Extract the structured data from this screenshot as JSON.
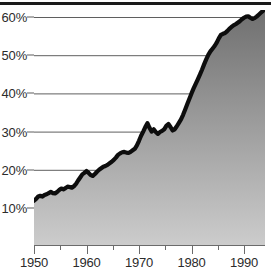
{
  "chart_data": {
    "type": "area",
    "title": "",
    "subtitle": "",
    "xlabel": "",
    "ylabel": "",
    "grid": true,
    "legend": null,
    "xlim": [
      1950,
      1994
    ],
    "ylim": [
      0,
      65
    ],
    "y_ticks": [
      10,
      20,
      30,
      40,
      50,
      60
    ],
    "y_tick_labels": [
      "10%",
      "20%",
      "30%",
      "40%",
      "50%",
      "60%"
    ],
    "x_ticks_major": [
      1950,
      1960,
      1970,
      1980,
      1990
    ],
    "x_tick_labels": [
      "1950",
      "1960",
      "1970",
      "1980",
      "1990"
    ],
    "x_ticks_minor": [
      1955,
      1965,
      1975,
      1985
    ],
    "series": [
      {
        "name": "percent",
        "x": [
          1950,
          1951,
          1952,
          1953,
          1954,
          1955,
          1956,
          1957,
          1958,
          1959,
          1960,
          1961,
          1962,
          1963,
          1964,
          1965,
          1966,
          1967,
          1968,
          1969,
          1970,
          1971,
          1972,
          1973,
          1974,
          1975,
          1976,
          1977,
          1978,
          1979,
          1980,
          1981,
          1982,
          1983,
          1984,
          1985,
          1986,
          1987,
          1988,
          1989,
          1990,
          1991,
          1992,
          1993,
          1994
        ],
        "values": [
          11.9,
          13.1,
          13.4,
          14.1,
          13.8,
          15.0,
          15.6,
          15.4,
          16.6,
          18.7,
          19.6,
          18.4,
          19.6,
          20.6,
          21.2,
          22.7,
          24.1,
          24.6,
          24.5,
          25.6,
          28.6,
          29.5,
          28.8,
          29.2,
          30.2,
          31.8,
          30.3,
          31.9,
          30.4,
          30.7,
          33.1,
          35.5,
          38.5,
          41.0,
          43.8,
          46.5,
          49.0,
          51.5,
          53.3,
          55.0,
          56.5,
          57.5,
          58.2,
          59.0,
          59.9
        ]
      }
    ],
    "dense_points": {
      "x": [
        1950.0,
        1950.4,
        1950.8,
        1951.2,
        1951.6,
        1952.0,
        1952.4,
        1952.8,
        1953.2,
        1953.6,
        1954.0,
        1954.4,
        1954.8,
        1955.2,
        1955.6,
        1956.0,
        1956.4,
        1956.8,
        1957.2,
        1957.6,
        1958.0,
        1958.4,
        1958.8,
        1959.2,
        1959.6,
        1960.0,
        1960.4,
        1960.8,
        1961.2,
        1961.6,
        1962.0,
        1962.4,
        1962.8,
        1963.2,
        1963.6,
        1964.0,
        1964.4,
        1964.8,
        1965.2,
        1965.6,
        1966.0,
        1966.4,
        1966.8,
        1967.2,
        1967.6,
        1968.0,
        1968.4,
        1968.8,
        1969.2,
        1969.6,
        1970.0,
        1970.4,
        1970.8,
        1971.2,
        1971.6,
        1972.0,
        1972.4,
        1972.8,
        1973.2,
        1973.6,
        1974.0,
        1974.4,
        1974.8,
        1975.2,
        1975.6,
        1976.0,
        1976.4,
        1976.8,
        1977.2,
        1977.6,
        1978.0,
        1978.4,
        1978.8,
        1979.2,
        1979.6,
        1980.0,
        1980.4,
        1980.8,
        1981.2,
        1981.6,
        1982.0,
        1982.4,
        1982.8,
        1983.2,
        1983.6,
        1984.0,
        1984.4,
        1984.8,
        1985.2,
        1985.6,
        1986.0,
        1986.4,
        1986.8,
        1987.2,
        1987.6,
        1988.0,
        1988.4,
        1988.8,
        1989.2,
        1989.6,
        1990.0,
        1990.4,
        1990.8,
        1991.2,
        1991.6,
        1992.0,
        1992.4,
        1992.8,
        1993.2,
        1993.6,
        1994.0
      ],
      "y": [
        11.9,
        12.4,
        13.0,
        13.2,
        13.0,
        13.4,
        13.6,
        13.9,
        14.2,
        13.9,
        13.8,
        14.2,
        14.7,
        15.1,
        14.9,
        15.2,
        15.6,
        15.5,
        15.3,
        15.7,
        16.3,
        17.2,
        18.0,
        18.8,
        19.2,
        19.7,
        19.2,
        18.6,
        18.4,
        18.9,
        19.5,
        20.0,
        20.4,
        20.8,
        21.0,
        21.3,
        21.7,
        22.1,
        22.6,
        23.2,
        23.9,
        24.3,
        24.6,
        24.7,
        24.5,
        24.4,
        24.7,
        25.1,
        25.5,
        26.4,
        27.6,
        28.9,
        30.0,
        31.2,
        32.2,
        31.0,
        30.0,
        30.6,
        29.9,
        29.4,
        29.9,
        30.2,
        30.6,
        31.5,
        32.0,
        31.2,
        30.3,
        30.6,
        31.4,
        32.3,
        33.2,
        34.4,
        35.8,
        37.2,
        38.6,
        40.0,
        41.3,
        42.5,
        43.7,
        44.9,
        46.2,
        47.6,
        48.9,
        50.1,
        51.0,
        51.7,
        52.4,
        53.3,
        54.4,
        55.3,
        55.6,
        55.8,
        56.3,
        56.9,
        57.4,
        57.8,
        58.1,
        58.5,
        58.9,
        59.4,
        59.8,
        60.1,
        60.2,
        59.8,
        59.5,
        59.7,
        60.1,
        60.6,
        61.1,
        61.6,
        62.1
      ]
    },
    "colors": {
      "line": "#0d0d0d",
      "fill_top": "#6f6f6f",
      "fill_bottom": "#cccccc",
      "gridline": "#5f5f5f",
      "axis": "#6b6b6b",
      "text": "#2b2b2b",
      "background": "#ffffff",
      "top_rule": "#1a1a1a"
    }
  }
}
